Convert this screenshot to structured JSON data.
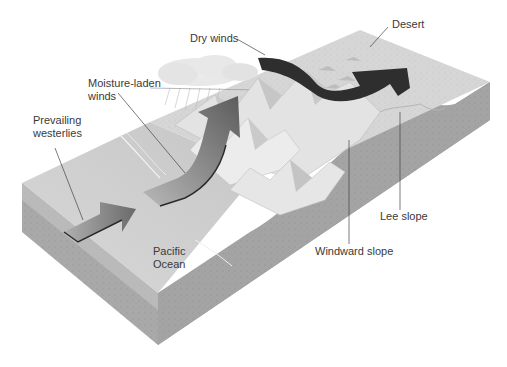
{
  "diagram": {
    "labels": {
      "dry_winds": "Dry winds",
      "desert": "Desert",
      "moisture_laden_winds": "Moisture-laden\nwinds",
      "prevailing_westerlies": "Prevailing\nwesterlies",
      "pacific_ocean": "Pacific\nOcean",
      "lee_slope": "Lee slope",
      "windward_slope": "Windward slope"
    },
    "colors": {
      "background": "#ffffff",
      "block_top": "#d4d4d4",
      "block_side_left": "#a9a9a9",
      "block_side_front": "#9c9c9c",
      "ocean": "#cfcfcf",
      "mountains": "#e6e6e6",
      "moist_arrow": "#7a7a7a",
      "dry_arrow": "#2e2e2e",
      "leader_line": "#444444",
      "text": "#3a3a3a"
    }
  }
}
